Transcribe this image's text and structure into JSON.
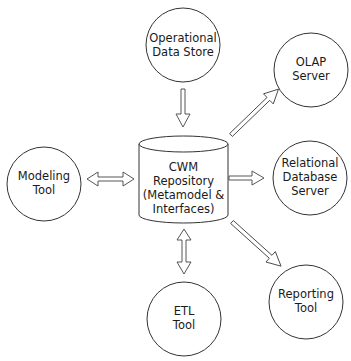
{
  "diagram": {
    "center": {
      "shape": "cylinder",
      "lines": [
        "CWM",
        "Repository",
        "(Metamodel &",
        "Interfaces)"
      ]
    },
    "nodes": [
      {
        "id": "ods",
        "shape": "circle",
        "lines": [
          "Operational",
          "Data Store"
        ]
      },
      {
        "id": "olap",
        "shape": "circle",
        "lines": [
          "OLAP",
          "Server"
        ]
      },
      {
        "id": "rdb",
        "shape": "circle",
        "lines": [
          "Relational",
          "Database",
          "Server"
        ]
      },
      {
        "id": "reporting",
        "shape": "circle",
        "lines": [
          "Reporting",
          "Tool"
        ]
      },
      {
        "id": "etl",
        "shape": "circle",
        "lines": [
          "ETL",
          "Tool"
        ]
      },
      {
        "id": "modeling",
        "shape": "circle",
        "lines": [
          "Modeling",
          "Tool"
        ]
      }
    ],
    "edges": [
      {
        "from": "ods",
        "to": "center",
        "direction": "one-way"
      },
      {
        "from": "center",
        "to": "olap",
        "direction": "one-way"
      },
      {
        "from": "center",
        "to": "rdb",
        "direction": "one-way"
      },
      {
        "from": "center",
        "to": "reporting",
        "direction": "one-way"
      },
      {
        "from": "center",
        "to": "etl",
        "direction": "two-way"
      },
      {
        "from": "center",
        "to": "modeling",
        "direction": "two-way"
      }
    ],
    "colors": {
      "stroke": "#333333",
      "fill": "#ffffff",
      "text": "#1a1a1a"
    }
  }
}
